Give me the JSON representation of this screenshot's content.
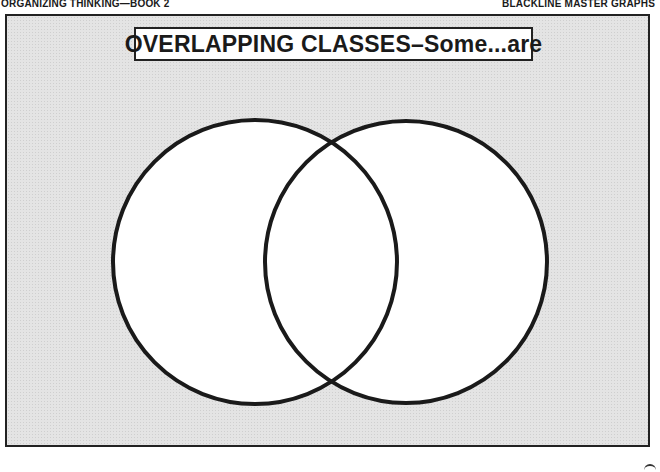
{
  "header": {
    "left": "ORGANIZING THINKING—BOOK 2",
    "right": "BLACKLINE MASTER GRAPHS"
  },
  "title": "OVERLAPPING CLASSES–Some...are",
  "diagram": {
    "type": "venn",
    "circles": [
      {
        "name": "left-class",
        "cx": 255,
        "cy": 262,
        "r": 142
      },
      {
        "name": "right-class",
        "cx": 406,
        "cy": 262,
        "r": 141
      }
    ],
    "stroke_color": "#1a1a1a",
    "fill_color": "#ffffff",
    "background_color": "#e4e4e4"
  }
}
